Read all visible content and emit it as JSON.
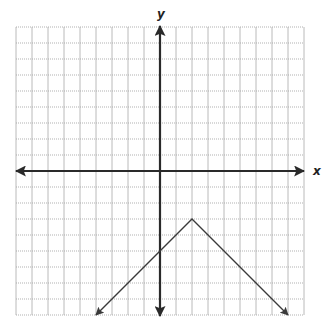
{
  "chart_data": {
    "type": "line",
    "title": "",
    "xlabel": "x",
    "ylabel": "y",
    "xlim": [
      -9,
      9
    ],
    "ylim": [
      -9,
      9
    ],
    "grid": true,
    "tick_labels": false,
    "function": "y = -|x - 2| - 3",
    "series": [
      {
        "name": "piecewise-linear",
        "points": [
          [
            -4,
            -9
          ],
          [
            2,
            -3
          ],
          [
            8,
            -9
          ]
        ],
        "arrows_at_ends": true,
        "vertex": [
          2,
          -3
        ],
        "y_intercept": -5
      }
    ]
  },
  "layout": {
    "origin_px": [
      160,
      171
    ],
    "unit_px": 16,
    "grid_color": "#a8a8a8",
    "axis_color": "#2a2a2a",
    "line_color": "#3a3a3a"
  },
  "labels": {
    "x_axis": "x",
    "y_axis": "y"
  }
}
